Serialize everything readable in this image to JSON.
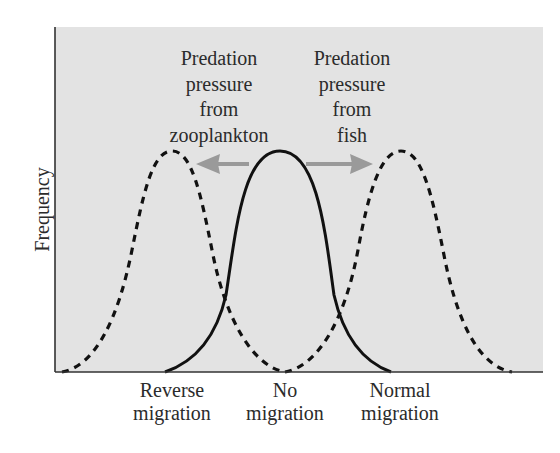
{
  "figure": {
    "background_color": "#e3e3e3",
    "curve_color": "#111111",
    "arrow_color": "#9a9a9a",
    "text_color": "#2b2b2b"
  },
  "y_axis": {
    "label": "Frequency"
  },
  "x_axis": {
    "categories": [
      {
        "line1": "Reverse",
        "line2": "migration"
      },
      {
        "line1": "No",
        "line2": "migration"
      },
      {
        "line1": "Normal",
        "line2": "migration"
      }
    ]
  },
  "annotations": {
    "left": {
      "lines": [
        "Predation",
        "pressure",
        "from",
        "zooplankton"
      ],
      "arrow_direction": "left"
    },
    "right": {
      "lines": [
        "Predation",
        "pressure",
        "from",
        "fish"
      ],
      "arrow_direction": "right"
    }
  },
  "curves": [
    {
      "name": "reverse-migration-distribution",
      "style": "dashed",
      "peak_category": "Reverse migration"
    },
    {
      "name": "no-migration-distribution",
      "style": "solid",
      "peak_category": "No migration"
    },
    {
      "name": "normal-migration-distribution",
      "style": "dashed",
      "peak_category": "Normal migration"
    }
  ]
}
